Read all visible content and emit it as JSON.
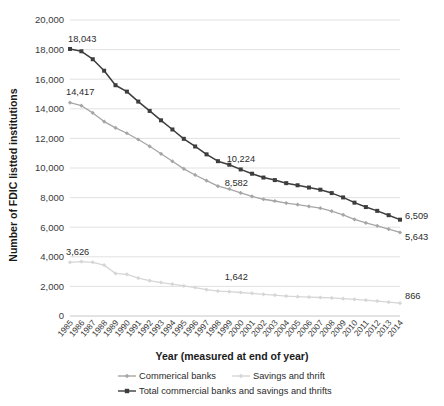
{
  "chart_data": {
    "type": "line",
    "title": "",
    "xlabel": "Year (measured at end of year)",
    "ylabel": "Number of FDIC listted institutions",
    "ylim": [
      0,
      20000
    ],
    "yticks": [
      0,
      2000,
      4000,
      6000,
      8000,
      10000,
      12000,
      14000,
      16000,
      18000,
      20000
    ],
    "ytick_labels": [
      "0",
      "2,000",
      "4,000",
      "6,000",
      "8,000",
      "10,000",
      "12,000",
      "14,000",
      "16,000",
      "18,000",
      "20,000"
    ],
    "grid": true,
    "legend_position": "bottom",
    "categories": [
      "1985",
      "1986",
      "1987",
      "1988",
      "1989",
      "1990",
      "1991",
      "1992",
      "1993",
      "1994",
      "1995",
      "1996",
      "1997",
      "1998",
      "1999",
      "2000",
      "2001",
      "2002",
      "2003",
      "2004",
      "2005",
      "2006",
      "2007",
      "2008",
      "2009",
      "2010",
      "2011",
      "2012",
      "2013",
      "2014"
    ],
    "series": [
      {
        "name": "Commerical banks",
        "color": "#a6a6a6",
        "marker": "diamond",
        "values": [
          14417,
          14210,
          13723,
          13137,
          12715,
          12347,
          11927,
          11467,
          10960,
          10452,
          9942,
          9530,
          9143,
          8774,
          8580,
          8315,
          8080,
          7888,
          7770,
          7631,
          7526,
          7402,
          7283,
          7086,
          6839,
          6530,
          6291,
          6096,
          5876,
          5643
        ],
        "end_label": "5,643",
        "start_label": "14,417",
        "mid_label": {
          "year": "2000",
          "value": 8582,
          "text": "8,582"
        }
      },
      {
        "name": "Savings and thrift",
        "color": "#d6d6d6",
        "marker": "diamond",
        "values": [
          3626,
          3677,
          3626,
          3438,
          2878,
          2815,
          2561,
          2390,
          2262,
          2152,
          2030,
          1924,
          1780,
          1687,
          1642,
          1589,
          1534,
          1467,
          1413,
          1345,
          1307,
          1279,
          1251,
          1219,
          1173,
          1128,
          1070,
          1008,
          936,
          866
        ],
        "end_label": "866",
        "start_label": "3,626",
        "mid_label": {
          "year": "2000",
          "value": 1642,
          "text": "1,642"
        }
      },
      {
        "name": "Total commercial banks and savings and thrifts",
        "color": "#3d3d3d",
        "marker": "square",
        "values": [
          18043,
          17887,
          17349,
          16575,
          15593,
          15162,
          14488,
          13857,
          13222,
          12604,
          11972,
          11454,
          10923,
          10461,
          10222,
          9904,
          9614,
          9355,
          9183,
          8976,
          8833,
          8681,
          8534,
          8305,
          8012,
          7658,
          7361,
          7104,
          6812,
          6509
        ],
        "end_label": "6,509",
        "start_label": "18,043",
        "mid_label": {
          "year": "2000",
          "value": 10224,
          "text": "10,224"
        }
      }
    ],
    "annotations": [
      {
        "text": "18,043",
        "series": "total",
        "x": "1985"
      },
      {
        "text": "14,417",
        "series": "commercial",
        "x": "1985"
      },
      {
        "text": "3,626",
        "series": "savings",
        "x": "1985"
      },
      {
        "text": "10,224",
        "series": "total",
        "x": "2000"
      },
      {
        "text": "8,582",
        "series": "commercial",
        "x": "2000"
      },
      {
        "text": "1,642",
        "series": "savings",
        "x": "2000"
      },
      {
        "text": "6,509",
        "series": "total",
        "x": "2014"
      },
      {
        "text": "5,643",
        "series": "commercial",
        "x": "2014"
      },
      {
        "text": "866",
        "series": "savings",
        "x": "2014"
      }
    ]
  },
  "legend": {
    "items": [
      {
        "label": "Commerical banks",
        "color": "#a6a6a6",
        "marker": "diamond"
      },
      {
        "label": "Savings and thrift",
        "color": "#d6d6d6",
        "marker": "diamond"
      },
      {
        "label": "Total commercial banks and savings and thrifts",
        "color": "#3d3d3d",
        "marker": "square"
      }
    ]
  }
}
